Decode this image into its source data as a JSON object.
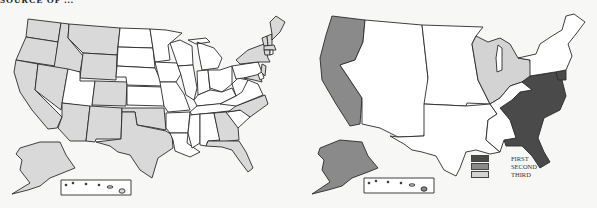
{
  "header": {
    "clipped_text": "SOURCE OF ..."
  },
  "colors": {
    "map1_fill": "#d9d9d9",
    "first": "#4a4a4a",
    "second": "#8a8a8a",
    "third": "#d3d3d3",
    "none": "#ffffff",
    "stroke": "#2a2a2a"
  },
  "left_map": {
    "title": "US states map (shaded states)",
    "shaded_states": [
      "WA",
      "OR",
      "CA",
      "ID",
      "NV",
      "MT",
      "WY",
      "CO",
      "AZ",
      "NM",
      "TX",
      "OK",
      "GA",
      "FL",
      "NC",
      "NY",
      "VT",
      "NH",
      "ME",
      "MD",
      "NJ",
      "CT",
      "MA",
      "AK"
    ],
    "unshaded_states": [
      "UT",
      "ND",
      "SD",
      "NE",
      "KS",
      "MN",
      "IA",
      "MO",
      "WI",
      "IL",
      "MI",
      "IN",
      "OH",
      "KY",
      "TN",
      "AR",
      "LA",
      "MS",
      "AL",
      "SC",
      "VA",
      "WV",
      "PA",
      "DE",
      "RI",
      "HI"
    ]
  },
  "right_map": {
    "title": "US regions map",
    "regions": [
      {
        "name": "Pacific",
        "rank": "SECOND"
      },
      {
        "name": "Alaska",
        "rank": "SECOND"
      },
      {
        "name": "Great Lakes",
        "rank": "THIRD"
      },
      {
        "name": "Southeast / Atlantic",
        "rank": "FIRST"
      },
      {
        "name": "Mountain",
        "rank": "NONE"
      },
      {
        "name": "Plains",
        "rank": "NONE"
      },
      {
        "name": "South Central",
        "rank": "NONE"
      },
      {
        "name": "Northeast",
        "rank": "NONE"
      },
      {
        "name": "Hawaii",
        "rank": "NONE"
      }
    ]
  },
  "legend": {
    "items": [
      {
        "label": "FIRST",
        "color": "#4a4a4a"
      },
      {
        "label": "SECOND",
        "color": "#8a8a8a"
      },
      {
        "label": "THIRD",
        "color": "#d3d3d3"
      }
    ]
  }
}
